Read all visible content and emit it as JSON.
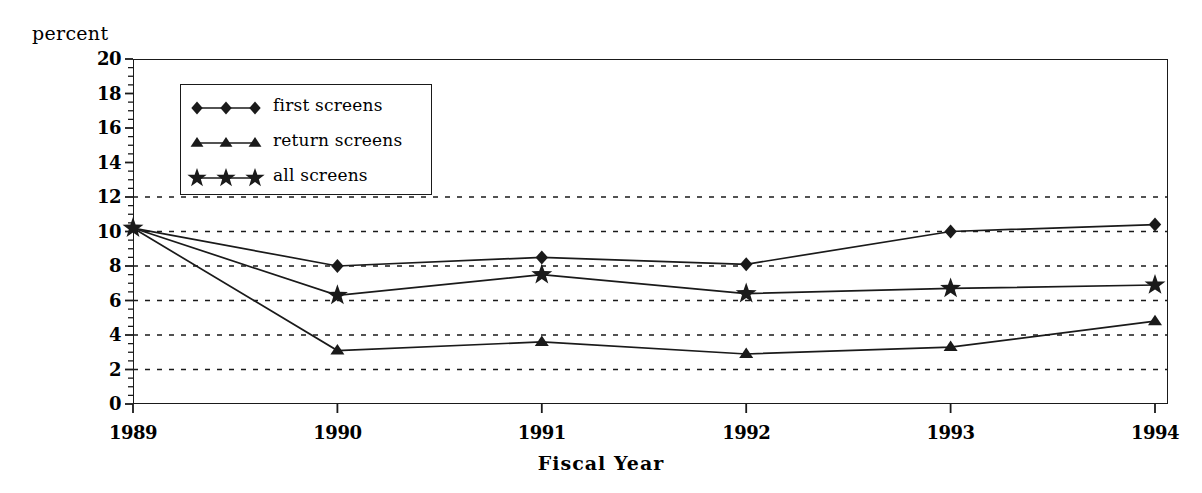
{
  "chart_data": {
    "type": "line",
    "title": "",
    "xlabel": "Fiscal Year",
    "ylabel": "percent",
    "categories": [
      "1989",
      "1990",
      "1991",
      "1992",
      "1993",
      "1994"
    ],
    "x": [
      1989,
      1990,
      1991,
      1992,
      1993,
      1994
    ],
    "ylim": [
      0,
      20
    ],
    "ytick_values": [
      0,
      2,
      4,
      6,
      8,
      10,
      12,
      14,
      16,
      18,
      20
    ],
    "ytick_labels": [
      "0",
      "2",
      "4",
      "6",
      "8",
      "10",
      "12",
      "14",
      "16",
      "18",
      "20"
    ],
    "xtick_labels": [
      "1989",
      "1990",
      "1991",
      "1992",
      "1993",
      "1994"
    ],
    "grid": "horizontal-dashed",
    "gridline_values": [
      2,
      4,
      6,
      8,
      10,
      12
    ],
    "minor_tick_step": 0.5,
    "legend_position": "upper-left-inside",
    "series": [
      {
        "name": "first screens",
        "marker": "diamond",
        "values": [
          10.2,
          8.0,
          8.5,
          8.1,
          10.0,
          10.4
        ]
      },
      {
        "name": "return screens",
        "marker": "triangle",
        "values": [
          10.2,
          3.1,
          3.6,
          2.9,
          3.3,
          4.8
        ]
      },
      {
        "name": "all screens",
        "marker": "star",
        "values": [
          10.2,
          6.3,
          7.5,
          6.4,
          6.7,
          6.9
        ]
      }
    ]
  },
  "legend": {
    "items": [
      {
        "label": "first screens",
        "marker": "diamond"
      },
      {
        "label": "return screens",
        "marker": "triangle"
      },
      {
        "label": "all screens",
        "marker": "star"
      }
    ]
  },
  "colors": {
    "ink": "#1a1a1a",
    "background": "#ffffff"
  }
}
